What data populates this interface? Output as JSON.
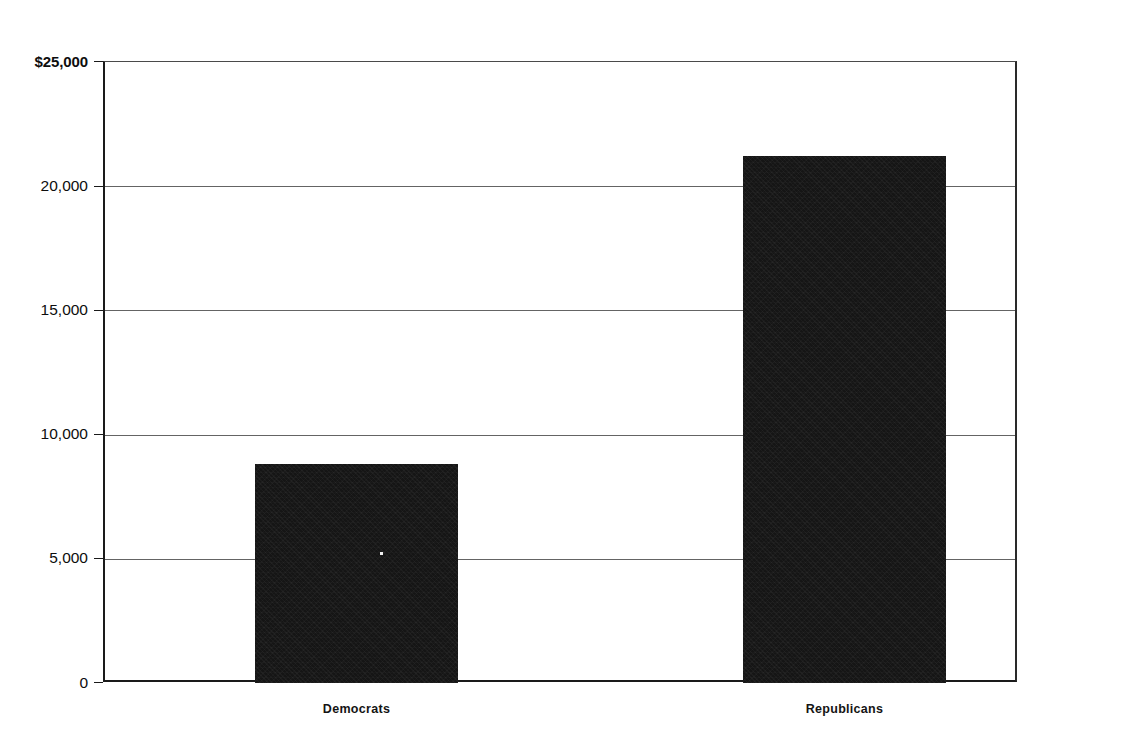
{
  "chart_data": {
    "type": "bar",
    "title": "",
    "subtitle": "",
    "xlabel": "",
    "ylabel": "",
    "categories": [
      "Democrats",
      "Republicans"
    ],
    "values": [
      8800,
      21200
    ],
    "series": [
      {
        "name": "Average contribution",
        "values": [
          8800,
          21200
        ]
      }
    ],
    "ylim": [
      0,
      25000
    ],
    "ytick_values": [
      0,
      5000,
      10000,
      15000,
      20000,
      25000
    ],
    "ytick_labels": [
      "0",
      "5,000",
      "10,000",
      "15,000",
      "20,000",
      "$25,000"
    ],
    "grid": true,
    "grid_axis": "y",
    "legend": false,
    "legend_position": "none",
    "bar_color": "#151515",
    "axis_color": "#1a1a1a",
    "grid_color": "#646464",
    "background_color": "#ffffff",
    "currency_symbol": "$",
    "annotations": []
  },
  "axis": {
    "y_labels": [
      {
        "text": "$25,000",
        "value": 25000,
        "bold": true
      },
      {
        "text": "20,000",
        "value": 20000,
        "bold": false
      },
      {
        "text": "15,000",
        "value": 15000,
        "bold": false
      },
      {
        "text": "10,000",
        "value": 10000,
        "bold": false
      },
      {
        "text": "5,000",
        "value": 5000,
        "bold": false
      },
      {
        "text": "0",
        "value": 0,
        "bold": false
      }
    ]
  },
  "bars": [
    {
      "label": "Democrats",
      "value": 8800
    },
    {
      "label": "Republicans",
      "value": 21200
    }
  ]
}
